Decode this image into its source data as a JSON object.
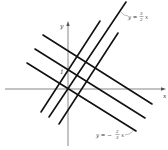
{
  "diagram": {
    "axes": {
      "x_label": "x",
      "y_label": "y",
      "tick_label": "1"
    },
    "labels": {
      "line_a": {
        "lhs": "y =",
        "num": "3",
        "den": "2",
        "var": "x"
      },
      "line_b": {
        "lhs": "y = −",
        "num": "2",
        "den": "3",
        "var": "x"
      }
    },
    "families": [
      {
        "name": "slope 3/2",
        "slope": "3/2",
        "line_count": 3
      },
      {
        "name": "slope -2/3",
        "slope": "-2/3",
        "line_count": 3
      }
    ],
    "line_color": "#111111",
    "axis_color": "#555555"
  }
}
